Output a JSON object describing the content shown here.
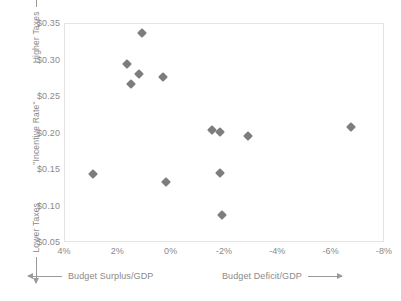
{
  "chart_data": {
    "type": "scatter",
    "title": "",
    "xlabel": "Budget Surplus/GDP  <->  Budget Deficit/GDP",
    "ylabel": "Lower Taxes <- \"Incentive Rate\" -> Higher Taxes",
    "xlim": [
      4,
      -8
    ],
    "ylim": [
      0.35,
      0.05
    ],
    "x_ticks": [
      4,
      2,
      0,
      -2,
      -4,
      -6,
      -8
    ],
    "x_tick_labels": [
      "4%",
      "2%",
      "0%",
      "-2%",
      "-4%",
      "-6%",
      "-8%"
    ],
    "y_ticks": [
      0.05,
      0.1,
      0.15,
      0.2,
      0.25,
      0.3,
      0.35
    ],
    "y_tick_labels": [
      "$0.05",
      "$0.10",
      "$0.15",
      "$0.20",
      "$0.25",
      "$0.30",
      "$0.35"
    ],
    "grid": false,
    "legend": null,
    "marker": "diamond",
    "marker_color": "#7d7d7d",
    "points": [
      {
        "x": 2.95,
        "y": 0.144
      },
      {
        "x": -1.87,
        "y": 0.089
      },
      {
        "x": 0.23,
        "y": 0.133
      },
      {
        "x": -1.8,
        "y": 0.146
      },
      {
        "x": -1.8,
        "y": 0.202
      },
      {
        "x": -1.5,
        "y": 0.205
      },
      {
        "x": -2.86,
        "y": 0.196
      },
      {
        "x": -6.74,
        "y": 0.209
      },
      {
        "x": 1.52,
        "y": 0.268
      },
      {
        "x": 1.22,
        "y": 0.281
      },
      {
        "x": 1.67,
        "y": 0.295
      },
      {
        "x": 0.31,
        "y": 0.278
      },
      {
        "x": 1.11,
        "y": 0.338
      }
    ]
  },
  "axes": {
    "y_label_low": "Lower Taxes",
    "y_label_mid": "\"Incentive Rate\"",
    "y_label_high": "Higher Taxes",
    "x_label_left": "Budget Surplus/GDP",
    "x_label_right": "Budget Deficit/GDP"
  },
  "colors": {
    "marker": "#7d7d7d",
    "text": "#8a8a8a",
    "axis_line": "#9a9a9a",
    "plot_border": "#e4e4e4",
    "background": "#ffffff"
  }
}
